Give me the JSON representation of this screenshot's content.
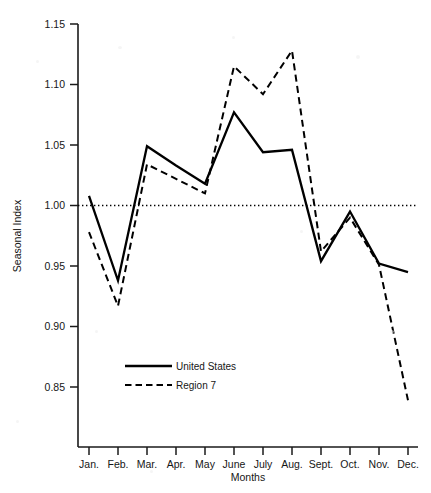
{
  "chart_data": {
    "type": "line",
    "title": "",
    "xlabel": "Months",
    "ylabel": "Seasonal Index",
    "categories": [
      "Jan.",
      "Feb.",
      "Mar.",
      "Apr.",
      "May",
      "June",
      "July",
      "Aug.",
      "Sept.",
      "Oct.",
      "Nov.",
      "Dec."
    ],
    "ylim": [
      0.82,
      1.155
    ],
    "xlim": [
      0,
      13
    ],
    "yticks": [
      0.85,
      0.9,
      0.95,
      1.0,
      1.05,
      1.1,
      1.15
    ],
    "ytick_labels": [
      "0.85",
      "0.90",
      "0.95",
      "1.00",
      "1.05",
      "1.10",
      "1.15"
    ],
    "grid": false,
    "legend_position": "lower-left-inside",
    "reference_line": {
      "value": 1.0,
      "style": "dotted",
      "color": "#000000"
    },
    "series": [
      {
        "name": "United States",
        "style": "solid",
        "color": "#000000",
        "values": [
          1.008,
          0.938,
          1.049,
          1.033,
          1.018,
          1.077,
          1.044,
          1.046,
          0.954,
          0.995,
          0.952,
          0.945
        ]
      },
      {
        "name": "Region 7",
        "style": "dashed",
        "color": "#000000",
        "values": [
          0.978,
          0.917,
          1.034,
          1.022,
          1.01,
          1.115,
          1.092,
          1.128,
          0.962,
          0.99,
          0.951,
          0.839
        ]
      }
    ]
  },
  "legend": {
    "entries": [
      {
        "label": "United States",
        "style": "solid"
      },
      {
        "label": "Region 7",
        "style": "dashed"
      }
    ]
  },
  "axes": {
    "y_title": "Seasonal Index",
    "x_title": "Months"
  }
}
